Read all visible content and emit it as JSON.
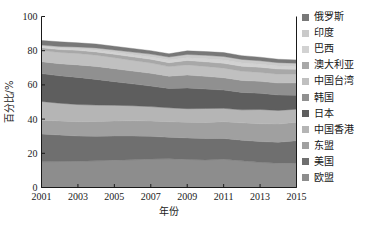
{
  "chart_data": {
    "type": "area",
    "title": "",
    "xlabel": "年份",
    "ylabel": "百分比/%",
    "xlim": [
      2001,
      2015
    ],
    "ylim": [
      0,
      100
    ],
    "ytick_labels": [
      "0",
      "20",
      "40",
      "60",
      "80",
      "100"
    ],
    "yticks": [
      0,
      20,
      40,
      60,
      80,
      100
    ],
    "xtick_labels": [
      "2001",
      "2003",
      "2005",
      "2007",
      "2009",
      "2011",
      "2013",
      "2015"
    ],
    "xticks": [
      2001,
      2003,
      2005,
      2007,
      2009,
      2011,
      2013,
      2015
    ],
    "x": [
      2001,
      2002,
      2003,
      2004,
      2005,
      2006,
      2007,
      2008,
      2009,
      2010,
      2011,
      2012,
      2013,
      2014,
      2015
    ],
    "grid": false,
    "legend_position": "right",
    "stacked": true,
    "stack_order_bottom_to_top": [
      "欧盟",
      "美国",
      "东盟",
      "中国香港",
      "日本",
      "韩国",
      "中国台湾",
      "澳大利亚",
      "巴西",
      "印度",
      "俄罗斯"
    ],
    "series": [
      {
        "name": "欧盟",
        "color": "#8d8d8d",
        "values": [
          15.0,
          15.2,
          15.3,
          15.6,
          16.0,
          16.2,
          16.6,
          16.8,
          16.4,
          16.1,
          16.5,
          15.6,
          14.7,
          14.2,
          14.4
        ]
      },
      {
        "name": "美国",
        "color": "#6f6f6f",
        "values": [
          16.3,
          15.5,
          14.8,
          14.3,
          14.1,
          13.9,
          13.3,
          12.6,
          12.6,
          12.5,
          12.2,
          12.1,
          12.2,
          12.3,
          13.0
        ]
      },
      {
        "name": "东盟",
        "color": "#a0a0a0",
        "values": [
          8.0,
          8.2,
          8.4,
          8.7,
          8.8,
          8.9,
          9.0,
          9.1,
          9.1,
          9.4,
          9.8,
          10.1,
          10.4,
          10.6,
          10.8
        ]
      },
      {
        "name": "中国香港",
        "color": "#b5b5b5",
        "values": [
          11.0,
          10.4,
          10.0,
          9.6,
          9.2,
          8.8,
          8.4,
          8.1,
          8.0,
          8.2,
          7.8,
          7.6,
          8.3,
          8.0,
          7.6
        ]
      },
      {
        "name": "日本",
        "color": "#5e5e5e",
        "values": [
          16.3,
          16.0,
          15.9,
          15.0,
          13.8,
          12.8,
          12.0,
          11.3,
          12.1,
          11.4,
          10.7,
          10.2,
          9.5,
          9.0,
          8.2
        ]
      },
      {
        "name": "韩国",
        "color": "#909090",
        "values": [
          7.0,
          7.1,
          7.3,
          7.6,
          7.6,
          7.5,
          7.5,
          7.2,
          7.6,
          7.4,
          7.2,
          7.0,
          7.0,
          7.0,
          7.2
        ]
      },
      {
        "name": "中国台湾",
        "color": "#c0c0c0",
        "values": [
          6.5,
          6.6,
          6.7,
          6.6,
          6.4,
          6.2,
          6.0,
          5.6,
          5.9,
          5.8,
          5.6,
          5.4,
          5.2,
          5.2,
          5.1
        ]
      },
      {
        "name": "澳大利亚",
        "color": "#a8a8a8",
        "values": [
          1.6,
          1.7,
          1.8,
          1.9,
          2.0,
          2.1,
          2.2,
          2.3,
          2.6,
          2.7,
          2.8,
          2.9,
          3.0,
          3.0,
          2.9
        ]
      },
      {
        "name": "巴西",
        "color": "#d2d2d2",
        "values": [
          0.7,
          0.8,
          0.9,
          1.0,
          1.1,
          1.2,
          1.3,
          1.5,
          1.6,
          1.8,
          1.9,
          1.9,
          1.8,
          1.7,
          1.5
        ]
      },
      {
        "name": "印度",
        "color": "#cacaca",
        "values": [
          0.9,
          1.0,
          1.1,
          1.3,
          1.4,
          1.6,
          1.7,
          1.8,
          1.9,
          2.0,
          2.1,
          2.1,
          2.0,
          2.0,
          2.0
        ]
      },
      {
        "name": "俄罗斯",
        "color": "#787878",
        "values": [
          2.7,
          2.7,
          2.4,
          2.3,
          2.2,
          2.1,
          2.0,
          1.9,
          2.1,
          2.2,
          2.3,
          2.2,
          2.1,
          2.0,
          1.9
        ]
      }
    ]
  },
  "axes": {
    "y_title": "百分比/%",
    "x_title": "年份",
    "y_ticks": [
      "100",
      "80",
      "60",
      "40",
      "20",
      "0"
    ],
    "x_ticks": [
      "2001",
      "2003",
      "2005",
      "2007",
      "2009",
      "2011",
      "2013",
      "2015"
    ]
  },
  "legend": {
    "items": [
      {
        "label": "俄罗斯",
        "color": "#787878"
      },
      {
        "label": "印度",
        "color": "#cacaca"
      },
      {
        "label": "巴西",
        "color": "#d2d2d2"
      },
      {
        "label": "澳大利亚",
        "color": "#a8a8a8"
      },
      {
        "label": "中国台湾",
        "color": "#c0c0c0"
      },
      {
        "label": "韩国",
        "color": "#909090"
      },
      {
        "label": "日本",
        "color": "#5e5e5e"
      },
      {
        "label": "中国香港",
        "color": "#b5b5b5"
      },
      {
        "label": "东盟",
        "color": "#a0a0a0"
      },
      {
        "label": "美国",
        "color": "#6f6f6f"
      },
      {
        "label": "欧盟",
        "color": "#8d8d8d"
      }
    ]
  }
}
